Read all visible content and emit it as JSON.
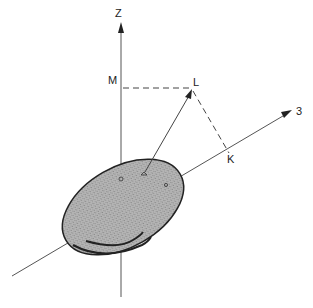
{
  "diagram": {
    "labels": {
      "z_axis": "Z",
      "axis_3": "3",
      "point_m": "M",
      "point_l": "L",
      "point_k": "K"
    },
    "colors": {
      "line": "#444444",
      "ellipse_fill": "#a8a8a8",
      "ellipse_stroke": "#222222"
    }
  }
}
